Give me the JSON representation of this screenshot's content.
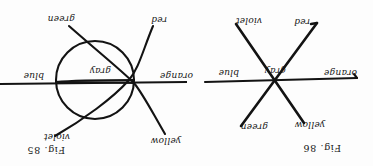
{
  "page": {
    "orientation": "upside-down",
    "rotation_degrees": 180,
    "background_color": "#fdfdfd",
    "ink_color": "#131313",
    "figure_count": 2
  },
  "figures": [
    {
      "id": "figure-86",
      "caption": "Fig. 86",
      "description": "three straight lines crossing at a single central point",
      "center_label": "gray",
      "labels": {
        "upper_left": "yellow",
        "upper_right": "green",
        "left": "orange",
        "right": "blue",
        "lower_left": "red",
        "lower_right": "violet",
        "center": "gray"
      }
    },
    {
      "id": "figure-85",
      "caption": "Fig. 85",
      "description": "central circle with four curved rays and one straight horizontal line crossing at two points on the circle",
      "center_label": "gray",
      "labels": {
        "upper_left": "yellow",
        "upper_right": "violet",
        "left": "orange",
        "right": "blue",
        "lower_left": "red",
        "lower_right": "green",
        "center": "gray"
      }
    }
  ]
}
